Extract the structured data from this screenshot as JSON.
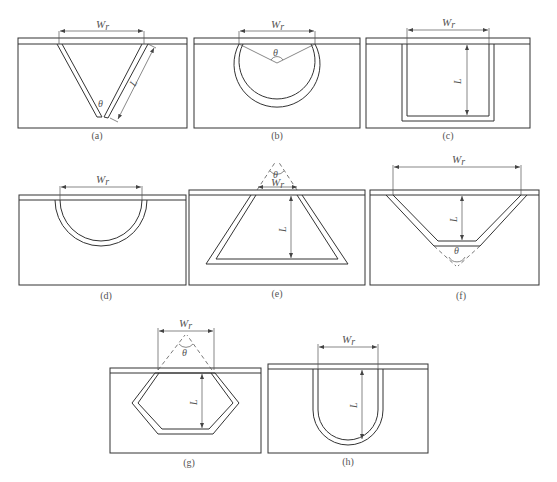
{
  "figure": {
    "symbols": {
      "width": "W",
      "width_sub": "r",
      "depth": "L",
      "angle": "θ"
    },
    "panels": [
      {
        "id": "a",
        "caption": "(a)",
        "shape": "V-groove",
        "labels": [
          "W_r",
          "L",
          "θ"
        ]
      },
      {
        "id": "b",
        "caption": "(b)",
        "shape": "circular",
        "labels": [
          "W_r",
          "θ"
        ]
      },
      {
        "id": "c",
        "caption": "(c)",
        "shape": "rectangular",
        "labels": [
          "W_r",
          "L"
        ]
      },
      {
        "id": "d",
        "caption": "(d)",
        "shape": "semicircular",
        "labels": [
          "W_r"
        ]
      },
      {
        "id": "e",
        "caption": "(e)",
        "shape": "trapezoid (inverted)",
        "labels": [
          "W_r",
          "L",
          "θ"
        ]
      },
      {
        "id": "f",
        "caption": "(f)",
        "shape": "trapezoid",
        "labels": [
          "W_r",
          "L",
          "θ"
        ]
      },
      {
        "id": "g",
        "caption": "(g)",
        "shape": "hexagonal",
        "labels": [
          "W_r",
          "L",
          "θ"
        ]
      },
      {
        "id": "h",
        "caption": "(h)",
        "shape": "U-shaped",
        "labels": [
          "W_r",
          "L"
        ]
      }
    ]
  }
}
